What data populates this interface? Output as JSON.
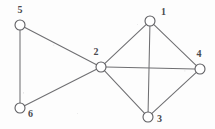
{
  "figure": {
    "kind": "undirected-graph-diagram",
    "width": 215,
    "height": 129,
    "background_color": "#fdfdfd",
    "edge_color": "#6f6f72",
    "node_stroke_color": "#5e5e62",
    "node_fill_color": "#ffffff",
    "label_color": "#4a4a4e",
    "node_radius": 5
  },
  "chart_data": {
    "type": "diagram",
    "title": "",
    "xlabel": "",
    "ylabel": "",
    "nodes": [
      {
        "id": "1",
        "label": "1",
        "x": 150,
        "y": 21,
        "label_x": 161,
        "label_y": 15,
        "label_anchor": "start"
      },
      {
        "id": "2",
        "label": "2",
        "x": 101,
        "y": 67,
        "label_x": 96,
        "label_y": 55,
        "label_anchor": "middle"
      },
      {
        "id": "3",
        "label": "3",
        "x": 148,
        "y": 117,
        "label_x": 157,
        "label_y": 122,
        "label_anchor": "start"
      },
      {
        "id": "4",
        "label": "4",
        "x": 200,
        "y": 69,
        "label_x": 199,
        "label_y": 57,
        "label_anchor": "middle"
      },
      {
        "id": "5",
        "label": "5",
        "x": 20,
        "y": 25,
        "label_x": 20,
        "label_y": 13,
        "label_anchor": "middle"
      },
      {
        "id": "6",
        "label": "6",
        "x": 20,
        "y": 108,
        "label_x": 28,
        "label_y": 117,
        "label_anchor": "start"
      }
    ],
    "edges": [
      {
        "source": "5",
        "target": "6",
        "name": "edge-5-6"
      },
      {
        "source": "5",
        "target": "2",
        "name": "edge-5-2"
      },
      {
        "source": "6",
        "target": "2",
        "name": "edge-6-2"
      },
      {
        "source": "2",
        "target": "1",
        "name": "edge-2-1"
      },
      {
        "source": "2",
        "target": "3",
        "name": "edge-2-3"
      },
      {
        "source": "2",
        "target": "4",
        "name": "edge-2-4"
      },
      {
        "source": "1",
        "target": "3",
        "name": "edge-1-3"
      },
      {
        "source": "1",
        "target": "4",
        "name": "edge-1-4"
      },
      {
        "source": "3",
        "target": "4",
        "name": "edge-3-4"
      }
    ]
  }
}
